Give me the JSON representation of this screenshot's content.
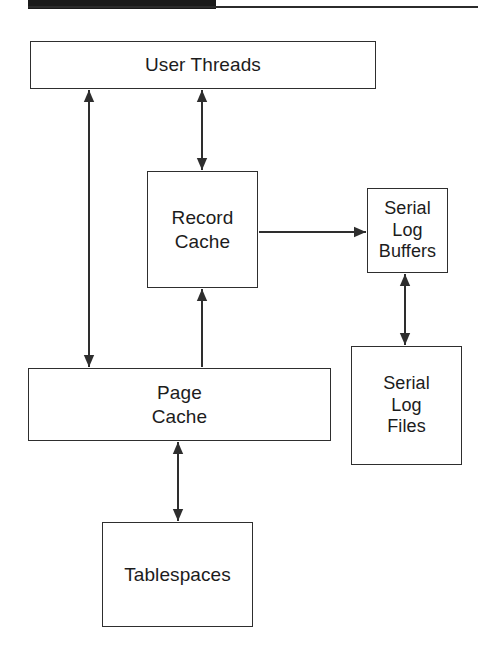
{
  "page": {
    "width": 483,
    "height": 660,
    "background": "#ffffff",
    "ink_color": "#2e2e2e",
    "text_color": "#1c1c1c"
  },
  "header": {
    "bar_color": "#1a1a1a",
    "rule_color": "#2b2b2b"
  },
  "diagram": {
    "type": "block-diagram",
    "title": "",
    "nodes": [
      {
        "id": "user-threads",
        "label": "User Threads",
        "x": 30,
        "y": 41,
        "w": 346,
        "h": 48,
        "font_size": 19
      },
      {
        "id": "record-cache",
        "label": "Record\nCache",
        "x": 147,
        "y": 171,
        "w": 111,
        "h": 117,
        "font_size": 19
      },
      {
        "id": "serial-log-buffers",
        "label": "Serial\nLog\nBuffers",
        "x": 367,
        "y": 188,
        "w": 81,
        "h": 85,
        "font_size": 18
      },
      {
        "id": "page-cache",
        "label": "Page\nCache",
        "x": 28,
        "y": 368,
        "w": 303,
        "h": 73,
        "font_size": 19
      },
      {
        "id": "serial-log-files",
        "label": "Serial\nLog\nFiles",
        "x": 351,
        "y": 346,
        "w": 111,
        "h": 119,
        "font_size": 18
      },
      {
        "id": "tablespaces",
        "label": "Tablespaces",
        "x": 102,
        "y": 522,
        "w": 151,
        "h": 105,
        "font_size": 19
      }
    ],
    "connectors": [
      {
        "id": "user-threads--page-cache",
        "from": "page-cache",
        "to": "user-threads",
        "orientation": "vertical",
        "direction": "both",
        "x": 89,
        "y1": 90,
        "y2": 367
      },
      {
        "id": "user-threads--record-cache",
        "from": "record-cache",
        "to": "user-threads",
        "orientation": "vertical",
        "direction": "both",
        "x": 202,
        "y1": 90,
        "y2": 170
      },
      {
        "id": "page-cache--record-cache",
        "from": "page-cache",
        "to": "record-cache",
        "orientation": "vertical",
        "direction": "up",
        "x": 202,
        "y1": 289,
        "y2": 367
      },
      {
        "id": "record-cache--serial-log-buffers",
        "from": "record-cache",
        "to": "serial-log-buffers",
        "orientation": "horizontal",
        "direction": "right",
        "y": 232,
        "x1": 259,
        "x2": 366
      },
      {
        "id": "serial-log-buffers--serial-log-files",
        "from": "serial-log-buffers",
        "to": "serial-log-files",
        "orientation": "vertical",
        "direction": "both",
        "x": 405,
        "y1": 274,
        "y2": 345
      },
      {
        "id": "page-cache--tablespaces",
        "from": "page-cache",
        "to": "tablespaces",
        "orientation": "vertical",
        "direction": "both",
        "x": 178,
        "y1": 442,
        "y2": 521
      }
    ]
  }
}
